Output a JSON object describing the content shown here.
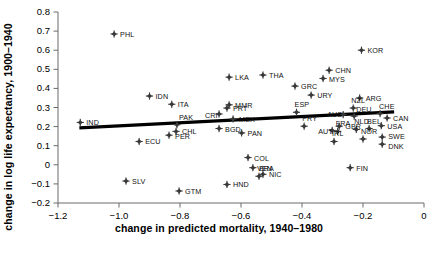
{
  "chart_data": {
    "type": "scatter",
    "title": "",
    "xlabel": "change in predicted mortality, 1940–1980",
    "ylabel": "change in log life expectancy, 1900–1940",
    "xlim": [
      -1.2,
      0.0
    ],
    "ylim": [
      -0.2,
      0.8
    ],
    "grid": false,
    "legend": "none",
    "xticks": [
      "−1.2",
      "−1.0",
      "−0.8",
      "−0.6",
      "−0.4",
      "−0.2",
      "0"
    ],
    "xtick_values": [
      -1.2,
      -1.0,
      -0.8,
      -0.6,
      -0.4,
      -0.2,
      0
    ],
    "yticks": [
      "0.8",
      "0.7",
      "0.6",
      "0.5",
      "0.4",
      "0.3",
      "0.2",
      "0.1",
      "0",
      "−0.1",
      "−0.2"
    ],
    "ytick_values": [
      0.8,
      0.7,
      0.6,
      0.5,
      0.4,
      0.3,
      0.2,
      0.1,
      0,
      -0.1,
      -0.2
    ],
    "marker": "diamond",
    "marker_color": "#3a3a3a",
    "trendline": {
      "color": "#000000",
      "x_start": -1.13,
      "y_start": 0.193,
      "x_end": -0.098,
      "y_end": 0.277
    },
    "points": [
      {
        "label": "PHL",
        "x": -1.016,
        "y": 0.685,
        "lx": 6,
        "ly": 0
      },
      {
        "label": "KOR",
        "x": -0.205,
        "y": 0.6,
        "lx": 6,
        "ly": 0
      },
      {
        "label": "CHN",
        "x": -0.311,
        "y": 0.495,
        "lx": 6,
        "ly": 0
      },
      {
        "label": "MYS",
        "x": -0.331,
        "y": 0.452,
        "lx": 6,
        "ly": 1
      },
      {
        "label": "LKA",
        "x": -0.639,
        "y": 0.459,
        "lx": 6,
        "ly": 0
      },
      {
        "label": "THA",
        "x": -0.528,
        "y": 0.47,
        "lx": 6,
        "ly": 0
      },
      {
        "label": "GRC",
        "x": -0.423,
        "y": 0.412,
        "lx": 6,
        "ly": 0
      },
      {
        "label": "URY",
        "x": -0.37,
        "y": 0.365,
        "lx": 6,
        "ly": 0
      },
      {
        "label": "ARG",
        "x": -0.211,
        "y": 0.35,
        "lx": 6,
        "ly": 0
      },
      {
        "label": "MMR",
        "x": -0.639,
        "y": 0.314,
        "lx": 6,
        "ly": 0
      },
      {
        "label": "IDN",
        "x": -0.9,
        "y": 0.36,
        "lx": 6,
        "ly": 0
      },
      {
        "label": "ITA",
        "x": -0.827,
        "y": 0.317,
        "lx": 6,
        "ly": 0
      },
      {
        "label": "PRT",
        "x": -0.646,
        "y": 0.297,
        "lx": 6,
        "ly": 0
      },
      {
        "label": "CRI",
        "x": -0.672,
        "y": 0.266,
        "lx": -14,
        "ly": 1
      },
      {
        "label": "MEX",
        "x": -0.626,
        "y": 0.24,
        "lx": 6,
        "ly": 0
      },
      {
        "label": "PAK",
        "x": -0.81,
        "y": 0.21,
        "lx": 2,
        "ly": -8
      },
      {
        "label": "ESP",
        "x": -0.418,
        "y": 0.275,
        "lx": -2,
        "ly": -8
      },
      {
        "label": "PRY",
        "x": -0.393,
        "y": 0.202,
        "lx": -2,
        "ly": -8
      },
      {
        "label": "AUS",
        "x": -0.265,
        "y": 0.263,
        "lx": -16,
        "ly": -1
      },
      {
        "label": "NZL",
        "x": -0.232,
        "y": 0.297,
        "lx": -2,
        "ly": -8
      },
      {
        "label": "DEU",
        "x": -0.229,
        "y": 0.255,
        "lx": 2,
        "ly": -7
      },
      {
        "label": "CHE",
        "x": -0.144,
        "y": 0.268,
        "lx": -1,
        "ly": -8
      },
      {
        "label": "CAN",
        "x": -0.121,
        "y": 0.245,
        "lx": 6,
        "ly": 0
      },
      {
        "label": "USA",
        "x": -0.14,
        "y": 0.205,
        "lx": 6,
        "ly": 0
      },
      {
        "label": "GBR",
        "x": -0.278,
        "y": 0.202,
        "lx": 6,
        "ly": 0
      },
      {
        "label": "NLD",
        "x": -0.222,
        "y": 0.185,
        "lx": -2,
        "ly": -8
      },
      {
        "label": "BEL",
        "x": -0.18,
        "y": 0.19,
        "lx": -2,
        "ly": -8
      },
      {
        "label": "AUT",
        "x": -0.301,
        "y": 0.18,
        "lx": -14,
        "ly": 1
      },
      {
        "label": "FRA",
        "x": -0.283,
        "y": 0.175,
        "lx": -2,
        "ly": -8
      },
      {
        "label": "IRL",
        "x": -0.295,
        "y": 0.122,
        "lx": -2,
        "ly": -8
      },
      {
        "label": "NOR",
        "x": -0.2,
        "y": 0.135,
        "lx": -2,
        "ly": -8
      },
      {
        "label": "SWE",
        "x": -0.137,
        "y": 0.145,
        "lx": 6,
        "ly": -1
      },
      {
        "label": "DNK",
        "x": -0.137,
        "y": 0.108,
        "lx": 6,
        "ly": 2
      },
      {
        "label": "FIN",
        "x": -0.242,
        "y": -0.015,
        "lx": 6,
        "ly": 0
      },
      {
        "label": "BGD",
        "x": -0.672,
        "y": 0.19,
        "lx": 6,
        "ly": 0
      },
      {
        "label": "PAN",
        "x": -0.598,
        "y": 0.167,
        "lx": 6,
        "ly": 0
      },
      {
        "label": "CHL",
        "x": -0.813,
        "y": 0.175,
        "lx": 6,
        "ly": 0
      },
      {
        "label": "PER",
        "x": -0.836,
        "y": 0.155,
        "lx": 6,
        "ly": 1
      },
      {
        "label": "IND",
        "x": -1.127,
        "y": 0.222,
        "lx": 6,
        "ly": 0
      },
      {
        "label": "ECU",
        "x": -0.934,
        "y": 0.122,
        "lx": 6,
        "ly": 0
      },
      {
        "label": "COL",
        "x": -0.577,
        "y": 0.038,
        "lx": 6,
        "ly": 0
      },
      {
        "label": "BRA",
        "x": -0.561,
        "y": -0.015,
        "lx": 6,
        "ly": 0
      },
      {
        "label": "NIC",
        "x": -0.528,
        "y": -0.05,
        "lx": 6,
        "ly": 0
      },
      {
        "label": "VEN",
        "x": -0.541,
        "y": -0.06,
        "lx": -2,
        "ly": -8
      },
      {
        "label": "HND",
        "x": -0.646,
        "y": -0.103,
        "lx": 6,
        "ly": 0
      },
      {
        "label": "SLV",
        "x": -0.977,
        "y": -0.085,
        "lx": 6,
        "ly": 0
      },
      {
        "label": "GTM",
        "x": -0.803,
        "y": -0.137,
        "lx": 6,
        "ly": 0
      }
    ]
  }
}
